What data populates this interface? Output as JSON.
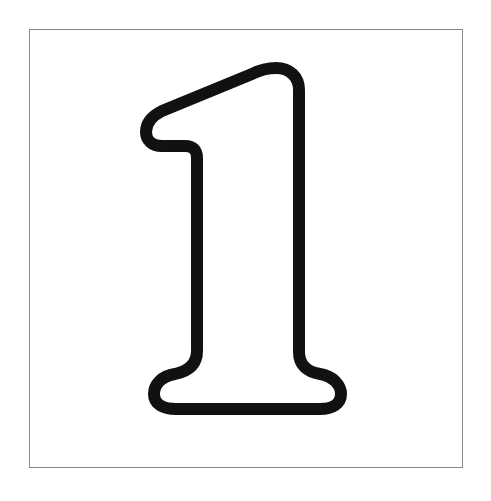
{
  "canvas": {
    "width": 491,
    "height": 501,
    "background_color": "#ffffff",
    "title": "Outlined Numeral One"
  },
  "frame": {
    "name": "border-frame",
    "stroke_color": "#8a8a8a",
    "stroke_width": 1,
    "fill_color": "#ffffff",
    "left": 29,
    "top": 29,
    "width": 434,
    "height": 439
  },
  "figure": {
    "name": "digit-one-outline",
    "label": "1",
    "stroke_color": "#111111",
    "fill_color": "#ffffff",
    "stroke_width": 12,
    "bounds": {
      "x_min": 145,
      "y_min": 62,
      "x_max": 347,
      "y_max": 414
    },
    "outline_path": "M 276 68 C 290 68 299 77 299 90 L 299 352 C 299 365 307 372 320 374 C 333 376 341 385 341 394 C 341 404 332 409 320 409 L 176 409 C 163 409 154 404 154 394 C 154 384 162 376 175 374 C 189 371 197 364 197 351 L 197 158 C 197 150 193 146 185 146 L 162 146 C 152 146 146 140 146 132 C 146 123 152 116 162 111 L 252 74 C 260 70 268 68 276 68 Z"
  }
}
